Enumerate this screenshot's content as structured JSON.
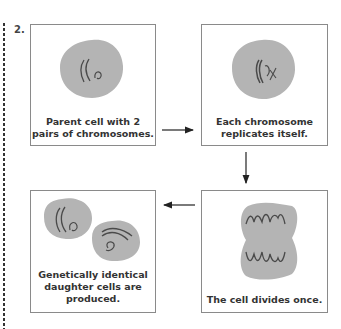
{
  "figure": {
    "number": "2.",
    "steps": [
      {
        "id": 1,
        "caption_lines": [
          "Parent cell with 2",
          "pairs of chromosomes."
        ]
      },
      {
        "id": 2,
        "caption_lines": [
          "Each chromosome",
          "replicates itself."
        ]
      },
      {
        "id": 3,
        "caption_lines": [
          "Genetically identical",
          "daughter cells are",
          "produced."
        ]
      },
      {
        "id": 4,
        "caption_lines": [
          "The cell divides once."
        ]
      }
    ],
    "flow": [
      "1 → 2 (right)",
      "2 → 4 (down)",
      "4 → 3 (left)"
    ],
    "colors": {
      "cell_fill": "#b4b4b4",
      "chromosome": "#4a4a4a",
      "box_border": "#8a8a8a",
      "arrow": "#222222"
    }
  }
}
